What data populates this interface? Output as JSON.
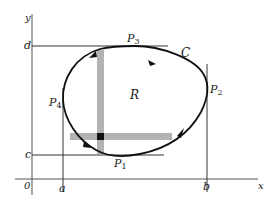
{
  "figure": {
    "axes": {
      "x_label": "x",
      "y_label": "y",
      "origin_label": "0"
    },
    "ticks": {
      "a": "a",
      "b": "b",
      "c": "c",
      "d": "d"
    },
    "points": [
      {
        "name": "P",
        "sub": "1",
        "position": "bottom"
      },
      {
        "name": "P",
        "sub": "2",
        "position": "right"
      },
      {
        "name": "P",
        "sub": "3",
        "position": "top"
      },
      {
        "name": "P",
        "sub": "4",
        "position": "left"
      }
    ],
    "curve_label": "C",
    "region_label": "R",
    "colors": {
      "ink": "#1a1a1a",
      "axis": "#555555",
      "strip": "#b3b3b3",
      "cell": "#111111",
      "background": "#ffffff"
    }
  }
}
